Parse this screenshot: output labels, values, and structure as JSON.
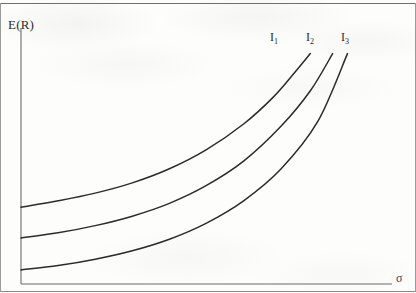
{
  "figure": {
    "background_color": "#fdfdfc",
    "ink_color": "#2b2b2b",
    "frame_color": "#8d8d8d"
  },
  "axes": {
    "y_label": "E(R)",
    "x_label": "σ",
    "y_axis_x": 21,
    "x_axis_y": 284,
    "origin": [
      21,
      284
    ],
    "x_axis_end": 392,
    "y_axis_top": 28
  },
  "curve_labels": [
    {
      "base": "I",
      "sub": "1"
    },
    {
      "base": "I",
      "sub": "2"
    },
    {
      "base": "I",
      "sub": "3"
    }
  ],
  "chart_data": {
    "type": "line",
    "title": "",
    "xlabel": "σ",
    "ylabel": "E(R)",
    "grid": false,
    "legend_position": "inline-curve-ends",
    "axis_style": "open-axes-no-ticks",
    "xlim": [
      0,
      1
    ],
    "ylim": [
      0,
      1
    ],
    "series": [
      {
        "name": "I1",
        "label": "I₁",
        "color": "#2b2b2b",
        "x": [
          0.0,
          0.1,
          0.2,
          0.3,
          0.4,
          0.5,
          0.6,
          0.68,
          0.74,
          0.78
        ],
        "y": [
          0.3,
          0.325,
          0.355,
          0.395,
          0.45,
          0.525,
          0.625,
          0.73,
          0.83,
          0.9
        ]
      },
      {
        "name": "I2",
        "label": "I₂",
        "color": "#2b2b2b",
        "x": [
          0.0,
          0.1,
          0.2,
          0.3,
          0.4,
          0.5,
          0.6,
          0.7,
          0.78,
          0.84
        ],
        "y": [
          0.18,
          0.2,
          0.228,
          0.265,
          0.315,
          0.385,
          0.48,
          0.615,
          0.755,
          0.9
        ]
      },
      {
        "name": "I3",
        "label": "I₃",
        "color": "#2b2b2b",
        "x": [
          0.0,
          0.1,
          0.2,
          0.3,
          0.4,
          0.5,
          0.6,
          0.7,
          0.8,
          0.88
        ],
        "y": [
          0.055,
          0.072,
          0.097,
          0.13,
          0.175,
          0.238,
          0.325,
          0.448,
          0.635,
          0.9
        ]
      }
    ]
  }
}
